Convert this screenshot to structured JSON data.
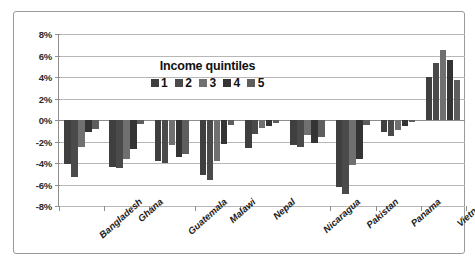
{
  "chart_data": {
    "type": "bar",
    "title": "",
    "subtitle": "",
    "xlabel": "",
    "ylabel": "",
    "categories": [
      "Bangladesh",
      "Ghana",
      "Guatemala",
      "Malawi",
      "Nepal",
      "Nicaragua",
      "Pakistan",
      "Panama",
      "Vietnam"
    ],
    "series": [
      {
        "name": "1",
        "color": "#3f3f3f",
        "values": [
          -4.1,
          -4.4,
          -3.8,
          -5.1,
          -2.6,
          -2.3,
          -6.2,
          -1.1,
          4.0
        ]
      },
      {
        "name": "2",
        "color": "#4a4a4a",
        "values": [
          -5.3,
          -4.5,
          -4.0,
          -5.6,
          -1.3,
          -2.5,
          -6.9,
          -1.5,
          5.3
        ]
      },
      {
        "name": "3",
        "color": "#707070",
        "values": [
          -2.5,
          -3.6,
          -2.3,
          -3.8,
          -0.7,
          -1.4,
          -4.2,
          -0.9,
          6.5
        ]
      },
      {
        "name": "4",
        "color": "#343434",
        "values": [
          -1.1,
          -2.7,
          -3.4,
          -2.2,
          -0.6,
          -2.1,
          -3.6,
          -0.6,
          5.6
        ]
      },
      {
        "name": "5",
        "color": "#5e5e5e",
        "values": [
          -0.8,
          -0.4,
          -3.2,
          -0.5,
          -0.3,
          -1.6,
          -0.5,
          -0.2,
          3.7
        ]
      }
    ],
    "ylim": [
      -8,
      8
    ],
    "ytick_values": [
      8,
      6,
      4,
      2,
      0,
      -2,
      -4,
      -6,
      -8
    ],
    "ytick_labels": [
      "8%",
      "6%",
      "4%",
      "2%",
      "0%",
      "-2%",
      "-4%",
      "-6%",
      "-8%"
    ],
    "grid": true,
    "legend_position": "inside-top-center",
    "legend_title": "Income quintiles",
    "legend_entries": [
      "1",
      "2",
      "3",
      "4",
      "5"
    ]
  },
  "legend": {
    "title": "Income quintiles"
  },
  "colors": {
    "frame": "#9a9a9a",
    "gridline": "#b7b7b7",
    "axis": "#8d8d8d",
    "background": "#ffffff",
    "text": "#1d1d1d"
  }
}
